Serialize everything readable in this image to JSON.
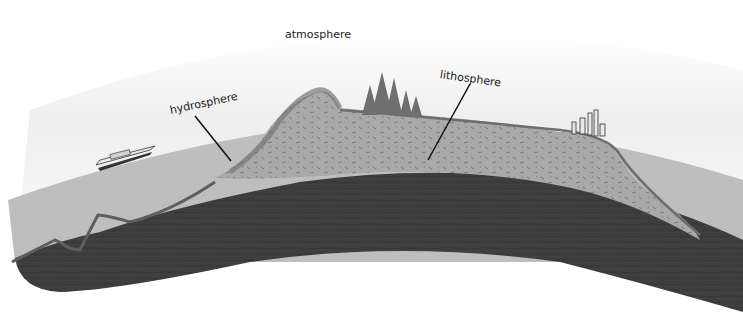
{
  "diagram": {
    "labels": {
      "atmosphere": "atmosphere",
      "hydrosphere": "hydrosphere",
      "lithosphere": "lithosphere"
    },
    "illustrated_features": [
      "ship",
      "ocean",
      "mountain",
      "forest",
      "city",
      "rock layers",
      "mantle"
    ],
    "colors": {
      "background": "#ffffff",
      "sky_haze": "#eeeeee",
      "ocean": "#bdbdbd",
      "crust_light": "#a8a8a8",
      "mantle_dark": "#3c3c3c",
      "strata": "#7a7a7a",
      "leader_line": "#111111"
    }
  }
}
